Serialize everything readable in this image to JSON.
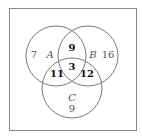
{
  "diagram": {
    "type": "venn",
    "sets": [
      {
        "name": "A",
        "only": "7"
      },
      {
        "name": "B",
        "only": "16"
      },
      {
        "name": "C",
        "only": "9"
      }
    ],
    "intersections": {
      "AB": "9",
      "AC": "11",
      "BC": "12",
      "ABC": "3"
    },
    "colors": {
      "stroke": "#777777",
      "border": "#888888",
      "text": "#555555",
      "bold_text": "#111111"
    }
  }
}
